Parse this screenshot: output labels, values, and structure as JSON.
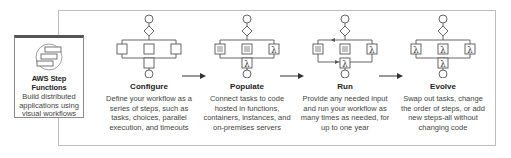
{
  "product": {
    "title": "AWS Step Functions",
    "description_lines": [
      "Build distributed",
      "applications using",
      "visual workflows"
    ],
    "icon": "step-functions-icon"
  },
  "stages": [
    {
      "title": "Configure",
      "icon": "workflow-empty-steps-icon",
      "description_lines": [
        "Define your workflow as a",
        "series of steps, such as",
        "tasks, choices, parallel",
        "execution, and timeouts"
      ]
    },
    {
      "title": "Populate",
      "icon": "workflow-populated-tasks-icon",
      "description_lines": [
        "Connect tasks to code",
        "hosted in functions,",
        "containers, instances, and",
        "on-premises servers"
      ]
    },
    {
      "title": "Run",
      "icon": "workflow-running-icon",
      "description_lines": [
        "Provide any needed input",
        "and run your workflow as",
        "many times as needed, for",
        "up to one year"
      ]
    },
    {
      "title": "Evolve",
      "icon": "workflow-lambda-steps-icon",
      "description_lines": [
        "Swap out tasks, change",
        "the order of steps, or add",
        "new steps-all without",
        "changing code"
      ]
    }
  ],
  "arrows": [
    "configure-to-populate",
    "populate-to-run",
    "run-to-evolve"
  ],
  "colors": {
    "stroke": "#555555",
    "frame": "#bdbdbd",
    "text": "#333333"
  }
}
